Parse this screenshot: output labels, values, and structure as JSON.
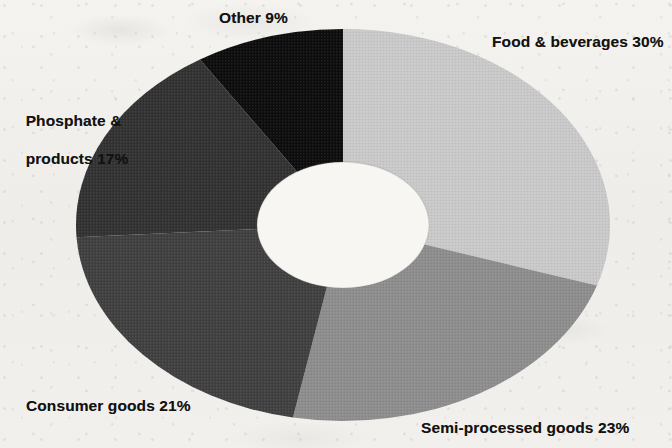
{
  "chart_data": {
    "type": "pie",
    "variant": "donut",
    "title": "",
    "subtitle": "",
    "xlabel": "",
    "ylabel": "",
    "units": "percent",
    "legend": "none",
    "grid": false,
    "labels_inline": true,
    "start_angle_deg": 0,
    "direction": "clockwise",
    "categories": [
      "Food & beverages",
      "Semi-processed goods",
      "Consumer goods",
      "Phosphate & products",
      "Other"
    ],
    "values": [
      30,
      23,
      21,
      17,
      9
    ],
    "total": 100,
    "slices": [
      {
        "name": "Food & beverages",
        "value": 30,
        "label": "Food & beverages 30%",
        "percent_text": "30%",
        "color": "#c9c9c9",
        "start_deg": 0,
        "end_deg": 108
      },
      {
        "name": "Semi-processed goods",
        "value": 23,
        "label": "Semi-processed goods 23%",
        "percent_text": "23%",
        "color": "#8d8d8d",
        "start_deg": 108,
        "end_deg": 190.8
      },
      {
        "name": "Consumer goods",
        "value": 21,
        "label": "Consumer goods 21%",
        "percent_text": "21%",
        "color": "#414141",
        "start_deg": 190.8,
        "end_deg": 266.4
      },
      {
        "name": "Phosphate & products",
        "value": 17,
        "label": "Phosphate & products 17%",
        "percent_text": "17%",
        "color": "#333333",
        "start_deg": 266.4,
        "end_deg": 327.6
      },
      {
        "name": "Other",
        "value": 9,
        "label": "Other 9%",
        "percent_text": "9%",
        "color": "#111111",
        "start_deg": 327.6,
        "end_deg": 360
      }
    ]
  },
  "labels": {
    "other": "Other 9%",
    "food": "Food & beverages 30%",
    "phosphate_line1": "Phosphate &",
    "phosphate_line2": "products 17%",
    "consumer": "Consumer goods 21%",
    "semi_processed": "Semi-processed goods 23%"
  },
  "colors": {
    "background": "#f2f1ee",
    "text": "#121212",
    "hole": "#f7f6f3",
    "food": "#c9c9c9",
    "semi_processed": "#8d8d8d",
    "consumer": "#414141",
    "phosphate": "#333333",
    "other": "#111111"
  }
}
